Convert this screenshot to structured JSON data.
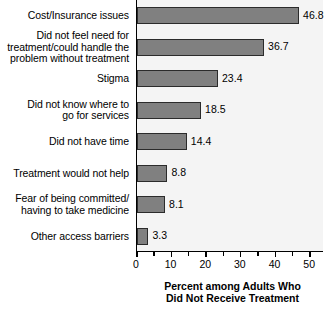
{
  "chart_data": {
    "type": "bar",
    "orientation": "horizontal",
    "title": "",
    "xlabel": "Percent among Adults Who Did Not Receive Treatment",
    "xlabel_lines": [
      "Percent among Adults Who",
      "Did Not Receive Treatment"
    ],
    "ylabel": "",
    "xlim": [
      0,
      54
    ],
    "xticks": [
      0,
      10,
      20,
      30,
      40,
      50
    ],
    "xtick_labels": [
      "0",
      "10",
      "20",
      "30",
      "40",
      "50"
    ],
    "minor_tick_step": 5,
    "grid": false,
    "legend": null,
    "bar_color": "#808080",
    "bar_edge_color": "#2b2b2b",
    "plot_background": "#f4f4f4",
    "categories": [
      "Cost/Insurance issues",
      "Did not feel need for treatment/could handle the problem without treatment",
      "Stigma",
      "Did not know where to go for services",
      "Did not have time",
      "Treatment would not help",
      "Fear of being committed/having to take medicine",
      "Other access barriers"
    ],
    "category_lines": [
      [
        "Cost/Insurance issues"
      ],
      [
        "Did not feel need for",
        "treatment/could handle the",
        "problem without treatment"
      ],
      [
        "Stigma"
      ],
      [
        "Did not know where to",
        "go for services"
      ],
      [
        "Did not have time"
      ],
      [
        "Treatment would not help"
      ],
      [
        "Fear of being committed/",
        "having to take medicine"
      ],
      [
        "Other access barriers"
      ]
    ],
    "values": [
      46.8,
      36.7,
      23.4,
      18.5,
      14.4,
      8.8,
      8.1,
      3.3
    ],
    "value_labels": [
      "46.8",
      "36.7",
      "23.4",
      "18.5",
      "14.4",
      "8.8",
      "8.1",
      "3.3"
    ]
  }
}
